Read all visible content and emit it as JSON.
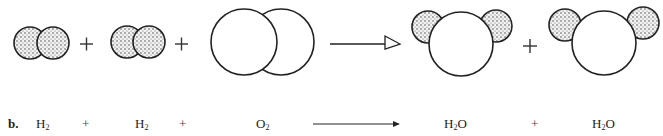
{
  "figure": {
    "label": "b.",
    "colors": {
      "stroke": "#222222",
      "hydrogen_fill": "#d9d9d9",
      "stipple": "#333333",
      "oxygen_fill": "#ffffff"
    },
    "molecule_row": [
      {
        "type": "molecule",
        "name": "H2",
        "atoms": [
          "H",
          "H"
        ]
      },
      {
        "type": "operator",
        "symbol": "+"
      },
      {
        "type": "molecule",
        "name": "H2",
        "atoms": [
          "H",
          "H"
        ]
      },
      {
        "type": "operator",
        "symbol": "+"
      },
      {
        "type": "molecule",
        "name": "O2",
        "atoms": [
          "O",
          "O"
        ]
      },
      {
        "type": "arrow",
        "symbol": "→"
      },
      {
        "type": "molecule",
        "name": "H2O",
        "atoms": [
          "H",
          "O",
          "H"
        ]
      },
      {
        "type": "operator",
        "symbol": "+"
      },
      {
        "type": "molecule",
        "name": "H2O",
        "atoms": [
          "H",
          "O",
          "H"
        ]
      }
    ],
    "equation_row": {
      "label": "b.",
      "terms": [
        {
          "base": "H",
          "sub": "2",
          "tail": ""
        },
        {
          "op": "+"
        },
        {
          "base": "H",
          "sub": "2",
          "tail": ""
        },
        {
          "op": "+"
        },
        {
          "base": "O",
          "sub": "2",
          "tail": ""
        },
        {
          "arrow": "→"
        },
        {
          "base": "H",
          "sub": "2",
          "tail": "O"
        },
        {
          "op": "+"
        },
        {
          "base": "H",
          "sub": "2",
          "tail": "O"
        }
      ]
    }
  }
}
